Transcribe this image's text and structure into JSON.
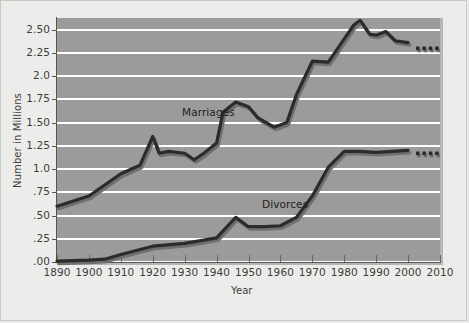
{
  "chart_data": {
    "type": "line",
    "title": "",
    "xlabel": "Year",
    "ylabel": "Number in Millions",
    "xlim": [
      1890,
      2010
    ],
    "ylim": [
      0,
      2.625
    ],
    "grid": true,
    "legend": "inline-labels",
    "x_tick_labels": [
      "1890",
      "1900",
      "1910",
      "1920",
      "1930",
      "1940",
      "1950",
      "1960",
      "1970",
      "1980",
      "1990",
      "2000",
      "2010"
    ],
    "y_tick_labels": [
      ".00",
      ".25",
      ".50",
      ".75",
      "1.0",
      "1.25",
      "1.50",
      "1.75",
      "2.0",
      "2.25",
      "2.50"
    ],
    "y_tick_values": [
      0,
      0.25,
      0.5,
      0.75,
      1.0,
      1.25,
      1.5,
      1.75,
      2.0,
      2.25,
      2.5
    ],
    "series": [
      {
        "name": "Marriages",
        "label_x": 1935,
        "label_y": 1.62,
        "x": [
          1890,
          1900,
          1910,
          1916,
          1920,
          1922,
          1925,
          1930,
          1933,
          1936,
          1940,
          1942,
          1946,
          1950,
          1953,
          1958,
          1962,
          1965,
          1970,
          1975,
          1980,
          1983,
          1985,
          1988,
          1990,
          1993,
          1996,
          2000
        ],
        "y": [
          0.6,
          0.71,
          0.95,
          1.04,
          1.35,
          1.17,
          1.19,
          1.17,
          1.1,
          1.17,
          1.28,
          1.61,
          1.72,
          1.67,
          1.55,
          1.45,
          1.5,
          1.8,
          2.16,
          2.15,
          2.4,
          2.55,
          2.6,
          2.45,
          2.44,
          2.48,
          2.38,
          2.36
        ],
        "projection_x": [
          2003,
          2005,
          2007,
          2009
        ],
        "projection_y": [
          2.3,
          2.3,
          2.3,
          2.3
        ],
        "style": "solid-thick-dark",
        "color": "#2b2b29"
      },
      {
        "name": "Divorces",
        "label_x": 1968,
        "label_y": 0.78,
        "x": [
          1890,
          1900,
          1905,
          1910,
          1920,
          1930,
          1940,
          1946,
          1950,
          1955,
          1960,
          1965,
          1970,
          1975,
          1980,
          1985,
          1990,
          1995,
          2000
        ],
        "y": [
          0.01,
          0.02,
          0.03,
          0.08,
          0.17,
          0.2,
          0.26,
          0.48,
          0.38,
          0.38,
          0.39,
          0.48,
          0.71,
          1.02,
          1.19,
          1.19,
          1.18,
          1.19,
          1.2
        ],
        "projection_x": [
          2003,
          2005,
          2007,
          2009
        ],
        "projection_y": [
          1.17,
          1.17,
          1.17,
          1.17
        ],
        "style": "solid-thick-dark",
        "color": "#2b2b29"
      }
    ],
    "colors": {
      "plot_background": "#9b9b9b",
      "figure_background": "#ececeb",
      "gridline": "#ffffff",
      "line": "#2b2b29",
      "line_shadow": "#6f6f6d",
      "axis": "#55544f",
      "text": "#3d3c38"
    }
  }
}
